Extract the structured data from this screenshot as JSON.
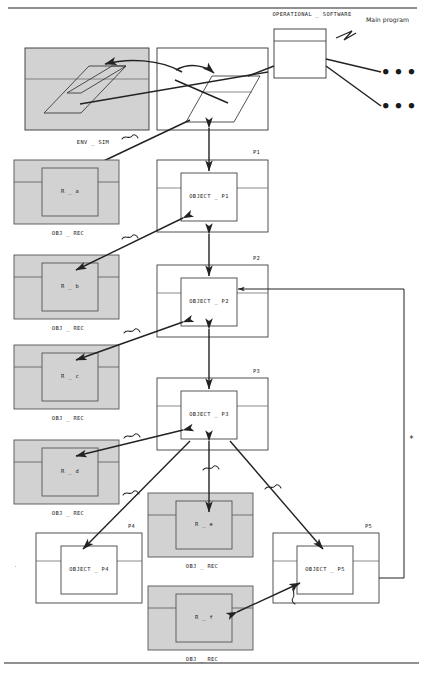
{
  "page": {
    "width": 423,
    "height": 677,
    "background": "#ffffff",
    "line_color": "#222222",
    "gray_fill": "#d2d2d2",
    "white_fill": "#ffffff"
  },
  "annotations": {
    "operational_software": "OPERATIONAL _ SOFTWARE",
    "main_program": "Main program",
    "env_sim": "ENV _ SIM",
    "asterisk": "*"
  },
  "process_labels": {
    "p1": "P1",
    "p2": "P2",
    "p3": "P3",
    "p4": "P4",
    "p5": "P5"
  },
  "object_boxes": [
    {
      "name": "OBJECT _ P1",
      "process": "P1"
    },
    {
      "name": "OBJECT _ P2",
      "process": "P2"
    },
    {
      "name": "OBJECT _ P3",
      "process": "P3"
    },
    {
      "name": "OBJECT _ P4",
      "process": "P4"
    },
    {
      "name": "OBJECT _ P5",
      "process": "P5"
    }
  ],
  "record_boxes": [
    {
      "name": "R _ a",
      "caption": "OBJ _ REC"
    },
    {
      "name": "R _ b",
      "caption": "OBJ _ REC"
    },
    {
      "name": "R _ c",
      "caption": "OBJ _ REC"
    },
    {
      "name": "R _ d",
      "caption": "OBJ _ REC"
    },
    {
      "name": "R _ e",
      "caption": "OBJ _ REC"
    },
    {
      "name": "R _ f",
      "caption": "OBJ _ REC"
    }
  ],
  "captions": {
    "obj_rec": "OBJ _ REC"
  },
  "ellipses": {
    "dots_row1": "● ● ●",
    "dots_row2": "● ● ●"
  }
}
